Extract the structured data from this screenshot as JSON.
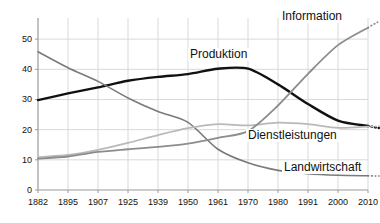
{
  "chart_data": {
    "type": "line",
    "title": "",
    "subtitle": "",
    "xlabel": "",
    "ylabel": "",
    "grid": true,
    "legend_position": "inline-annotations",
    "x": [
      1882,
      1895,
      1907,
      1925,
      1939,
      1950,
      1961,
      1970,
      1980,
      1991,
      2000,
      2010
    ],
    "categories": [
      "1882",
      "1895",
      "1907",
      "1925",
      "1939",
      "1950",
      "1961",
      "1970",
      "1980",
      "1991",
      "2000",
      "2010"
    ],
    "xlim": [
      1882,
      2010
    ],
    "ylim": [
      0,
      57
    ],
    "yticks": [
      0,
      10,
      20,
      30,
      40,
      50
    ],
    "ytick_labels": [
      "0",
      "10",
      "20",
      "30",
      "40",
      "50"
    ],
    "series": [
      {
        "name": "Produktion",
        "color": "#111111",
        "width": 2.4,
        "values": [
          29.8,
          32.0,
          34.0,
          36.2,
          37.5,
          38.4,
          40.2,
          40.2,
          35.0,
          28.5,
          23.0,
          21.2
        ],
        "dotted_tail": true
      },
      {
        "name": "Landwirtschaft",
        "color": "#7a7a7a",
        "width": 1.6,
        "values": [
          45.8,
          40.5,
          36.0,
          30.5,
          26.0,
          22.4,
          13.5,
          9.0,
          6.5,
          5.4,
          4.9,
          4.7
        ],
        "dotted_tail": true
      },
      {
        "name": "Dienstleistungen",
        "color": "#b9b9b9",
        "width": 1.8,
        "values": [
          10.9,
          11.6,
          13.3,
          15.6,
          18.2,
          20.5,
          21.8,
          21.4,
          22.3,
          21.8,
          20.6,
          21.0
        ],
        "dotted_tail": true
      },
      {
        "name": "Information",
        "color": "#8c8c8c",
        "width": 1.8,
        "values": [
          10.4,
          11.1,
          12.6,
          13.5,
          14.3,
          15.4,
          17.3,
          19.5,
          28.0,
          38.5,
          48.0,
          53.8
        ],
        "dotted_tail": true
      }
    ],
    "annotations": [
      {
        "text": "Produktion",
        "series": "Produktion"
      },
      {
        "text": "Information",
        "series": "Information"
      },
      {
        "text": "Dienstleistungen",
        "series": "Dienstleistungen"
      },
      {
        "text": "Landwirtschaft",
        "series": "Landwirtschaft"
      }
    ]
  },
  "labels": {
    "produktion": "Produktion",
    "information": "Information",
    "dienstleistungen": "Dienstleistungen",
    "landwirtschaft": "Landwirtschaft"
  },
  "colors": {
    "produktion": "#111111",
    "landwirtschaft": "#7a7a7a",
    "dienstleistungen": "#b9b9b9",
    "information": "#8c8c8c",
    "grid": "#d9d9d9",
    "axis": "#9a9a9a",
    "background": "#ffffff"
  }
}
